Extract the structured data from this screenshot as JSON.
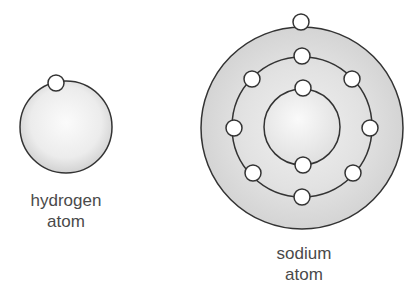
{
  "diagram": {
    "type": "atomic-structure",
    "colors": {
      "stroke": "#333333",
      "electron_fill": "#ffffff",
      "nucleus_light": "#f7f7f7",
      "shell_band": "#d9d9d9"
    },
    "atoms": [
      {
        "id": "hydrogen",
        "label_line1": "hydrogen",
        "label_line2": "atom",
        "center": [
          66,
          127
        ],
        "shells": [
          {
            "radius": 46,
            "electrons": 1
          }
        ]
      },
      {
        "id": "sodium",
        "label_line1": "sodium",
        "label_line2": "atom",
        "center": [
          302,
          127
        ],
        "shells": [
          {
            "radius": 38,
            "electrons": 2
          },
          {
            "radius": 70,
            "electrons": 8
          },
          {
            "radius": 102,
            "electrons": 1
          }
        ]
      }
    ]
  }
}
